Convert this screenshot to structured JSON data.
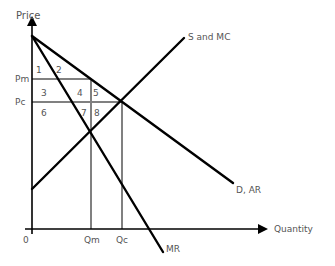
{
  "axes": {
    "y_label": "Price",
    "x_label": "Quantity",
    "origin_label": "0"
  },
  "price_levels": {
    "pm": "Pm",
    "pc": "Pc"
  },
  "quantity_levels": {
    "qm": "Qm",
    "qc": "Qc"
  },
  "curves": {
    "supply": "S and MC",
    "demand": "D, AR",
    "marginal_revenue": "MR"
  },
  "regions": [
    "1",
    "2",
    "3",
    "4",
    "5",
    "6",
    "7",
    "8"
  ],
  "colors": {
    "curve": "#000000",
    "guide": "#808080",
    "text": "#555555"
  }
}
